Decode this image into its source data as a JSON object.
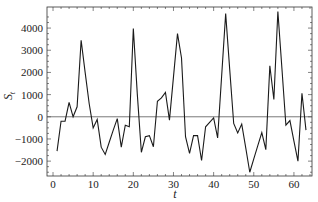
{
  "chart_data": {
    "type": "line",
    "title": "",
    "xlabel": "t",
    "ylabel": "S_t",
    "xlim": [
      -1.5,
      64.5
    ],
    "ylim": [
      -2670,
      4950
    ],
    "grid": false,
    "legend": null,
    "xticks": [
      0,
      10,
      20,
      30,
      40,
      50,
      60
    ],
    "yticks": [
      -2000,
      -1000,
      0,
      1000,
      2000,
      3000,
      4000
    ],
    "xtick_labels": [
      "0",
      "10",
      "20",
      "30",
      "40",
      "50",
      "60"
    ],
    "ytick_labels": [
      "−2000",
      "−1000",
      "0",
      "1000",
      "2000",
      "3000",
      "4000"
    ],
    "reference_line": 0,
    "series": [
      {
        "name": "S_t",
        "color": "#1a1a1a",
        "x": [
          1,
          2,
          3,
          4,
          5,
          6,
          7,
          8,
          9,
          10,
          11,
          12,
          13,
          14,
          15,
          16,
          17,
          18,
          19,
          20,
          21,
          22,
          23,
          24,
          25,
          26,
          27,
          28,
          29,
          30,
          31,
          32,
          33,
          34,
          35,
          36,
          37,
          38,
          39,
          40,
          41,
          42,
          43,
          44,
          45,
          46,
          47,
          48,
          49,
          50,
          51,
          52,
          53,
          54,
          55,
          56,
          57,
          58,
          59,
          60,
          61,
          62,
          63
        ],
        "values": [
          -1550,
          -200,
          -200,
          650,
          0,
          450,
          3450,
          2000,
          600,
          -500,
          -120,
          -1370,
          -1700,
          -1150,
          -600,
          -80,
          -1370,
          -380,
          -450,
          3980,
          1000,
          -1600,
          -900,
          -850,
          -1350,
          700,
          850,
          1100,
          -150,
          1800,
          3750,
          2650,
          -900,
          -1650,
          -850,
          -850,
          -1970,
          -450,
          -250,
          -50,
          -950,
          1850,
          4650,
          2150,
          -300,
          -730,
          -330,
          -1400,
          -2500,
          -1900,
          -1300,
          -710,
          -1480,
          2300,
          780,
          4750,
          2200,
          -380,
          -170,
          -1100,
          -2000,
          1060,
          -600
        ]
      }
    ]
  },
  "labels": {
    "x_axis": "t",
    "y_axis_main": "S",
    "y_axis_sub": "t"
  }
}
